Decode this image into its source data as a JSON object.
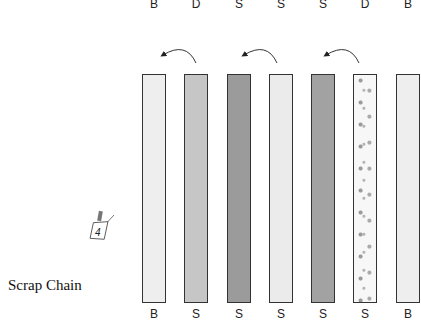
{
  "title": "Scrap Chain",
  "top_labels": [
    "B",
    "D",
    "S",
    "S",
    "S",
    "D",
    "B"
  ],
  "bottom_labels": [
    "B",
    "S",
    "S",
    "S",
    "S",
    "S",
    "B"
  ],
  "strips": [
    {
      "fabric": "background",
      "color": "#eeeeee"
    },
    {
      "fabric": "scrap-medium",
      "color": "#c6c6c6"
    },
    {
      "fabric": "scrap-dark",
      "color": "#9b9b9b"
    },
    {
      "fabric": "scrap-light",
      "color": "#ebebeb"
    },
    {
      "fabric": "scrap-dark",
      "color": "#a2a2a2"
    },
    {
      "fabric": "scrap-floral",
      "color": "#f6f6f6"
    },
    {
      "fabric": "background",
      "color": "#eeeeee"
    }
  ],
  "tag": {
    "number": "4"
  },
  "arrows": 3
}
